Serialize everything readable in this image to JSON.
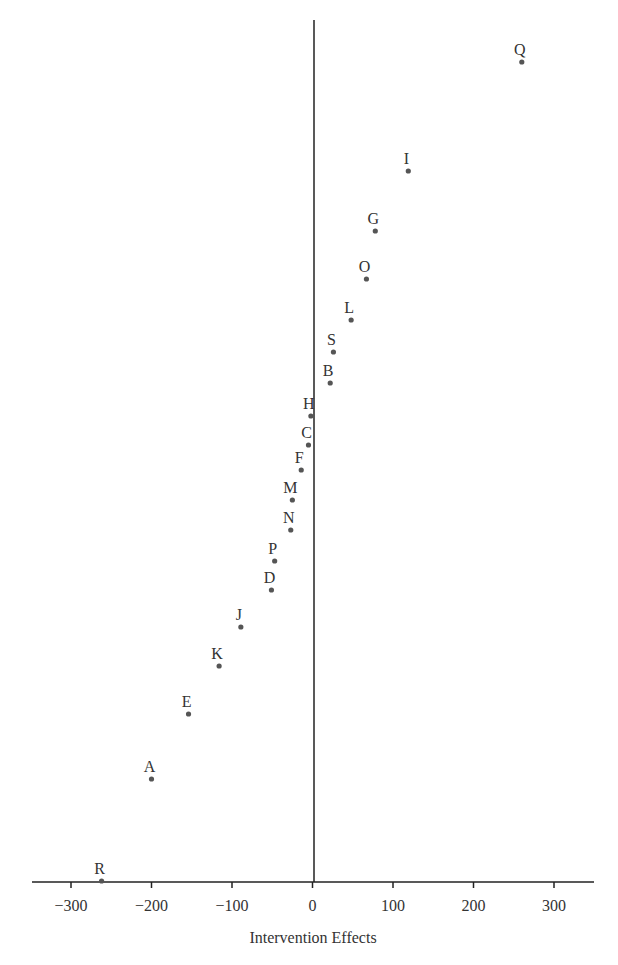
{
  "chart_data": {
    "type": "scatter",
    "title": "",
    "xlabel": "Intervention Effects",
    "ylabel": "",
    "xlim": [
      -340,
      350
    ],
    "xticks": [
      -300,
      -200,
      -100,
      0,
      100,
      200,
      300
    ],
    "xtick_labels": [
      "−300",
      "−200",
      "−100",
      "0",
      "100",
      "200",
      "300"
    ],
    "grid": false,
    "legend": null,
    "reference_line": {
      "orientation": "vertical",
      "x": 0
    },
    "points": [
      {
        "label": "Q",
        "x": 260,
        "rank": 19
      },
      {
        "label": "I",
        "x": 119,
        "rank": 18
      },
      {
        "label": "G",
        "x": 78,
        "rank": 17
      },
      {
        "label": "O",
        "x": 67,
        "rank": 16
      },
      {
        "label": "L",
        "x": 48,
        "rank": 15
      },
      {
        "label": "S",
        "x": 26,
        "rank": 14
      },
      {
        "label": "B",
        "x": 22,
        "rank": 13
      },
      {
        "label": "H",
        "x": -2,
        "rank": 12
      },
      {
        "label": "C",
        "x": -5,
        "rank": 11
      },
      {
        "label": "F",
        "x": -14,
        "rank": 10
      },
      {
        "label": "M",
        "x": -25,
        "rank": 9
      },
      {
        "label": "N",
        "x": -27,
        "rank": 8
      },
      {
        "label": "P",
        "x": -47,
        "rank": 7
      },
      {
        "label": "D",
        "x": -51,
        "rank": 6
      },
      {
        "label": "J",
        "x": -89,
        "rank": 5
      },
      {
        "label": "K",
        "x": -116,
        "rank": 4
      },
      {
        "label": "E",
        "x": -154,
        "rank": 3
      },
      {
        "label": "A",
        "x": -200,
        "rank": 2
      },
      {
        "label": "R",
        "x": -262,
        "rank": 1
      }
    ],
    "point_pixel_y": {
      "Q": 62,
      "I": 171,
      "G": 231,
      "O": 279,
      "L": 320,
      "S": 352,
      "B": 383,
      "H": 416,
      "C": 445,
      "F": 470,
      "M": 500,
      "N": 530,
      "P": 561,
      "D": 590,
      "J": 627,
      "K": 666,
      "E": 714,
      "A": 779,
      "R": 881
    },
    "colors": {
      "point": "#555555",
      "axis": "#222222",
      "text": "#333333"
    }
  }
}
